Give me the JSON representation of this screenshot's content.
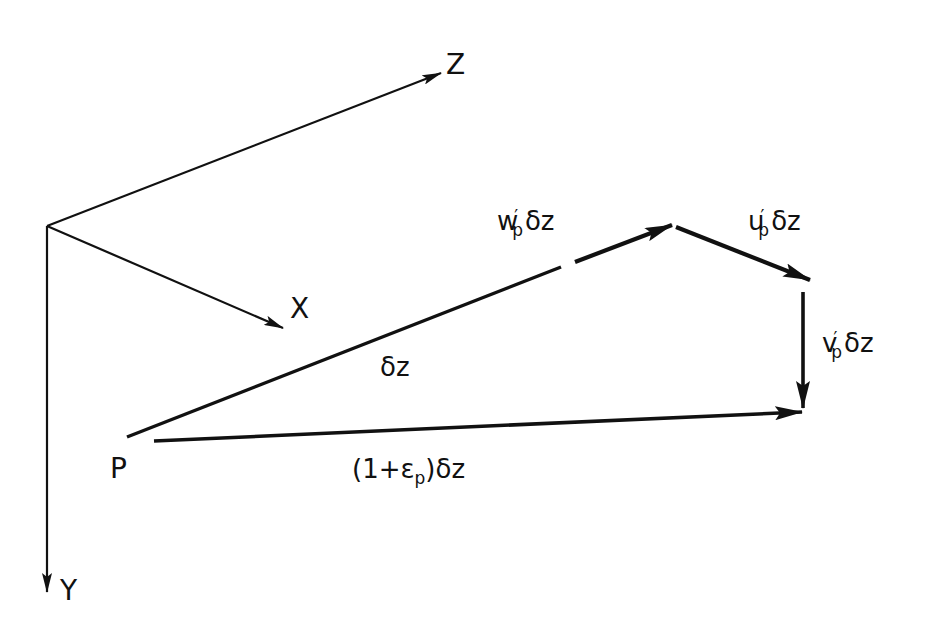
{
  "diagram": {
    "type": "vector-geometry",
    "colors": {
      "ink": "#111111",
      "background": "#ffffff"
    },
    "axes": {
      "origin": [
        47,
        226
      ],
      "x": {
        "label": "X",
        "tip": [
          283,
          328
        ]
      },
      "y": {
        "label": "Y",
        "tip": [
          48,
          592
        ]
      },
      "z": {
        "label": "Z",
        "tip": [
          441,
          73
        ]
      }
    },
    "point": {
      "label": "P"
    },
    "vectors": {
      "dz": {
        "label": "δz",
        "base": "δz"
      },
      "w": {
        "base": "w",
        "prime": "′",
        "sub": "p",
        "tail": "δz"
      },
      "u": {
        "base": "u",
        "prime": "′",
        "sub": "p",
        "tail": "δz"
      },
      "v": {
        "base": "v",
        "prime": "′",
        "sub": "p",
        "tail": "δz"
      },
      "stretched": {
        "prefix": "(1+ε",
        "sub": "p",
        "suffix": ")δz"
      }
    }
  }
}
